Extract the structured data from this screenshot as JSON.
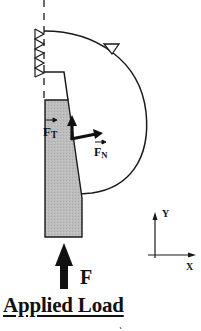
{
  "diagram": {
    "title": "Applied Load",
    "labels": {
      "tangential_force": {
        "symbol": "F",
        "subscript": "T"
      },
      "normal_force": {
        "symbol": "F",
        "subscript": "N"
      },
      "applied_force": "F",
      "axis_y": "Y",
      "axis_x": "X"
    },
    "colors": {
      "stroke": "#1a1a1a",
      "block_fill": "#b9b9b9",
      "background": "#ffffff"
    },
    "elements": [
      "fixed-support-hatched",
      "dashed-centerline",
      "curved-contact-body",
      "roller-support-triangle",
      "shaded-loading-block",
      "tangential-force-arrow",
      "normal-force-arrow",
      "applied-load-arrow",
      "xy-coordinate-axes"
    ]
  }
}
